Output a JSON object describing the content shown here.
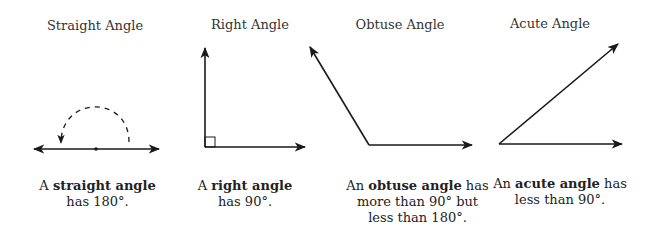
{
  "diagram": {
    "panels": [
      {
        "id": "straight",
        "title": "Straight Angle",
        "caption": {
          "prefix": "A ",
          "term": "straight angle",
          "suffix": "",
          "line2": "has 180°.",
          "line3": ""
        },
        "degrees": 180
      },
      {
        "id": "right",
        "title": "Right Angle",
        "caption": {
          "prefix": "A ",
          "term": "right angle",
          "suffix": "",
          "line2": "has 90°.",
          "line3": ""
        },
        "degrees": 90
      },
      {
        "id": "obtuse",
        "title": "Obtuse Angle",
        "caption": {
          "prefix": "An ",
          "term": "obtuse angle",
          "suffix": " has",
          "line2": "more than 90° but",
          "line3": "less than 180°."
        },
        "degrees": "between 90 and 180"
      },
      {
        "id": "acute",
        "title": "Acute Angle",
        "caption": {
          "prefix": "An ",
          "term": "acute angle",
          "suffix": " has",
          "line2": "less than 90°.",
          "line3": ""
        },
        "degrees": "less than 90"
      }
    ],
    "colors": {
      "stroke": "#1a1a1a",
      "text": "#2a2a2a",
      "background": "#ffffff"
    }
  }
}
